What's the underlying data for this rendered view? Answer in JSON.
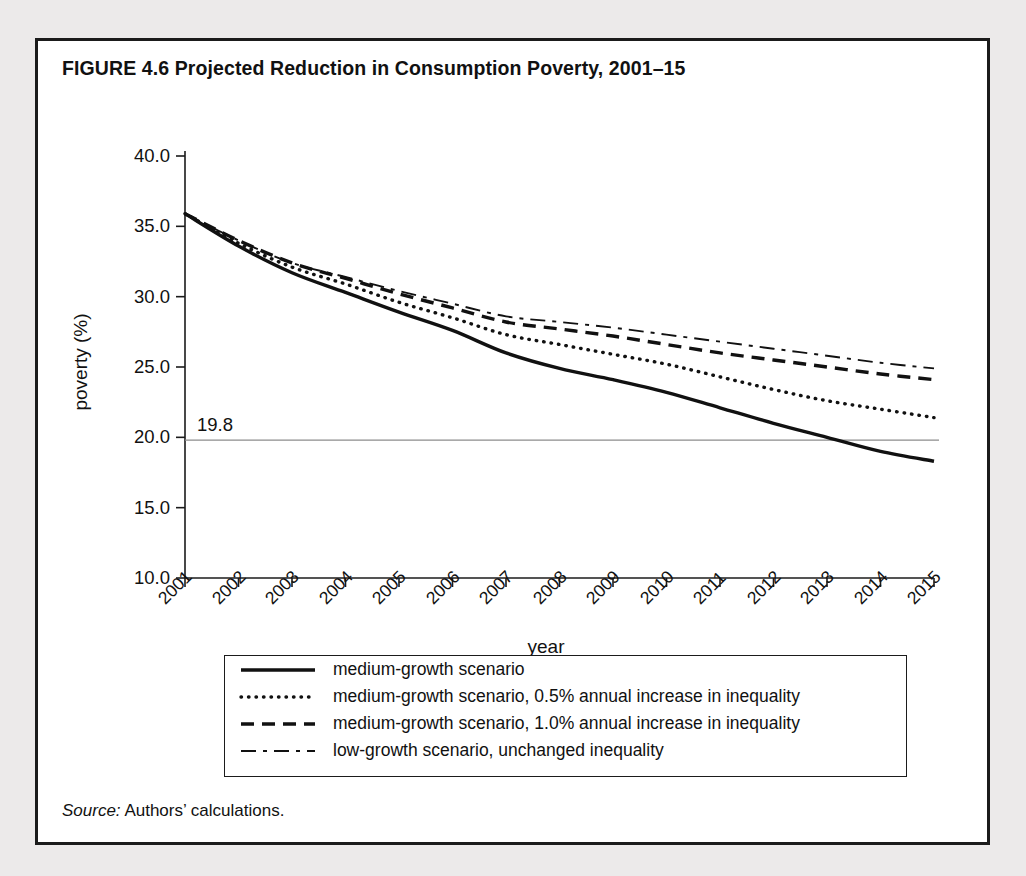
{
  "figure": {
    "title": "FIGURE 4.6  Projected Reduction in Consumption Poverty, 2001–15",
    "source_prefix": "Source:",
    "source_text": " Authors’ calculations."
  },
  "axis_title_label": "year",
  "y_axis_title_label": "poverty (%)",
  "reference_label": "19.8",
  "legend": {
    "items": [
      {
        "style": "solid",
        "label": "medium-growth scenario"
      },
      {
        "style": "dotted",
        "label": "medium-growth scenario, 0.5% annual increase in inequality"
      },
      {
        "style": "dashed",
        "label": "medium-growth scenario, 1.0% annual increase in inequality"
      },
      {
        "style": "dashdot",
        "label": "low-growth scenario, unchanged inequality"
      }
    ]
  },
  "chart_data": {
    "type": "line",
    "title": "Projected Reduction in Consumption Poverty, 2001–15",
    "xlabel": "year",
    "ylabel": "poverty (%)",
    "xlim": [
      2001,
      2015
    ],
    "ylim": [
      10.0,
      40.0
    ],
    "yticks": [
      "40.0",
      "35.0",
      "30.0",
      "25.0",
      "20.0",
      "15.0",
      "10.0"
    ],
    "ytick_values": [
      40.0,
      35.0,
      30.0,
      25.0,
      20.0,
      15.0,
      10.0
    ],
    "grid": false,
    "legend_position": "below-plot",
    "x": [
      2001,
      2002,
      2003,
      2004,
      2005,
      2006,
      2007,
      2008,
      2009,
      2010,
      2011,
      2012,
      2013,
      2014,
      2015
    ],
    "annotations": [
      {
        "text": "19.8",
        "type": "reference-line",
        "y": 19.8,
        "line_style": "thin-solid"
      }
    ],
    "series": [
      {
        "name": "medium-growth scenario",
        "style": "solid",
        "values": [
          35.9,
          33.6,
          31.7,
          30.3,
          28.9,
          27.6,
          26.0,
          24.9,
          24.1,
          23.2,
          22.1,
          21.0,
          20.0,
          19.0,
          18.3
        ]
      },
      {
        "name": "medium-growth scenario, 0.5% annual increase in inequality",
        "style": "dotted",
        "values": [
          35.9,
          33.8,
          32.1,
          30.9,
          29.6,
          28.5,
          27.3,
          26.6,
          25.9,
          25.2,
          24.3,
          23.4,
          22.6,
          22.0,
          21.4
        ]
      },
      {
        "name": "medium-growth scenario, 1.0% annual increase in inequality",
        "style": "dashed",
        "values": [
          35.9,
          34.0,
          32.4,
          31.3,
          30.2,
          29.2,
          28.2,
          27.7,
          27.2,
          26.6,
          26.0,
          25.5,
          25.0,
          24.5,
          24.1
        ]
      },
      {
        "name": "low-growth scenario, unchanged inequality",
        "style": "dashdot",
        "values": [
          35.9,
          34.0,
          32.4,
          31.4,
          30.4,
          29.5,
          28.6,
          28.2,
          27.8,
          27.3,
          26.8,
          26.3,
          25.8,
          25.3,
          24.9
        ]
      }
    ],
    "colors": {
      "line": "#111111",
      "reference_line": "#8c8c8c",
      "background": "#ffffff"
    }
  }
}
